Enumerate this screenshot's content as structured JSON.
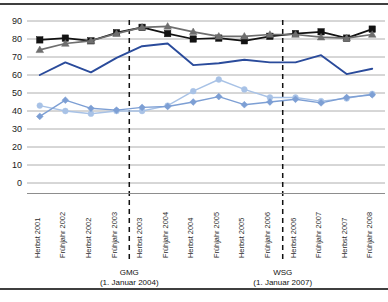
{
  "chart_data": {
    "type": "line",
    "title": "",
    "xlabel": "",
    "ylabel": "",
    "ylim": [
      0,
      90
    ],
    "ytick_step": 10,
    "grid": true,
    "legend": "none",
    "categories": [
      "Herbst 2001",
      "Frühjahr 2002",
      "Herbst 2002",
      "Frühjahr 2003",
      "Herbst 2003",
      "Frühjahr 2004",
      "Herbst 2004",
      "Frühjahr 2005",
      "Herbst 2005",
      "Frühjahr 2006",
      "Herbst 2006",
      "Frühjahr 2007",
      "Herbst 2007",
      "Frühjahr 2008"
    ],
    "yticks": [
      "0",
      "10",
      "20",
      "30",
      "40",
      "50",
      "60",
      "70",
      "80",
      "90"
    ],
    "series": [
      {
        "name": "series-black-square",
        "color": "#121212",
        "marker": "square",
        "values": [
          79.5,
          80.5,
          79.0,
          83.5,
          86.5,
          83.0,
          80.0,
          80.5,
          79.0,
          81.5,
          83.0,
          84.0,
          80.5,
          85.5
        ]
      },
      {
        "name": "series-gray-triangle",
        "color": "#6e6e6e",
        "marker": "triangle",
        "values": [
          74.0,
          77.5,
          79.0,
          83.0,
          86.5,
          87.0,
          84.0,
          81.5,
          81.5,
          82.5,
          82.5,
          81.0,
          80.5,
          82.5
        ]
      },
      {
        "name": "series-darkblue-line",
        "color": "#2a4b9b",
        "marker": "none",
        "values": [
          60.0,
          67.0,
          61.5,
          69.5,
          76.0,
          77.5,
          65.5,
          66.5,
          68.5,
          67.0,
          67.0,
          71.0,
          60.5,
          63.5
        ]
      },
      {
        "name": "series-palelblue-circle",
        "color": "#a8c2e6",
        "marker": "circle",
        "values": [
          43.0,
          40.0,
          38.5,
          40.0,
          40.0,
          43.0,
          51.0,
          57.5,
          52.0,
          47.5,
          47.5,
          45.5,
          47.0,
          49.5
        ]
      },
      {
        "name": "series-midblue-diamond",
        "color": "#7d9fd4",
        "marker": "diamond",
        "values": [
          37.0,
          46.0,
          41.5,
          40.5,
          42.0,
          42.5,
          45.0,
          48.0,
          43.5,
          45.0,
          46.5,
          44.5,
          47.5,
          49.0
        ]
      }
    ],
    "event_markers": [
      {
        "label": "GMG",
        "sublabel": "(1. Januar 2004)",
        "between_index": 4
      },
      {
        "label": "WSG",
        "sublabel": "(1. Januar 2007)",
        "between_index": 10
      }
    ]
  }
}
